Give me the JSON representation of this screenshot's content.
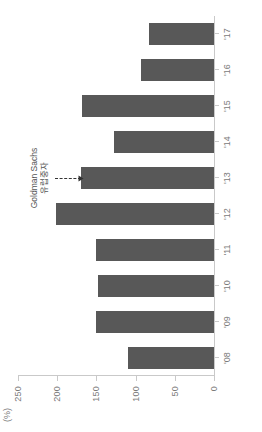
{
  "chart_data": {
    "type": "bar",
    "title": "",
    "xlabel": "",
    "ylabel": "",
    "unit_label": "(%)",
    "categories": [
      "'08",
      "'09",
      "'10",
      "'11",
      "'12",
      "'13",
      "'14",
      "'15",
      "'16",
      "'17"
    ],
    "values": [
      110,
      150,
      148,
      150,
      202,
      170,
      127,
      168,
      93,
      83
    ],
    "ylim": [
      0,
      250
    ],
    "yticks": [
      0,
      50,
      100,
      150,
      200,
      250
    ],
    "ytick_labels": [
      "0",
      "50",
      "100",
      "150",
      "200",
      "250"
    ],
    "grid": false,
    "legend": "none",
    "bar_color": "#585858",
    "axis_color": "#c9c9c9",
    "tick_text_color": "#7a7a7a",
    "orientation": "rotated-90-ccw",
    "annotations": [
      {
        "name": "goldman-sachs-callout",
        "line1": "Goldman Sachs",
        "line2": "유럽중자",
        "target_category": "'13",
        "target_value": 170,
        "arrow": "dashed-right"
      }
    ]
  }
}
